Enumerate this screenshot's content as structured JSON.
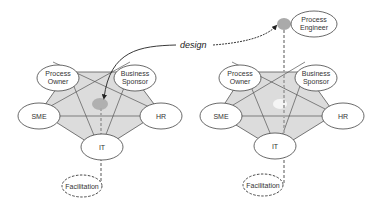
{
  "diagram": {
    "annotation": "design",
    "left": {
      "nodes": {
        "process_owner": [
          "Process",
          "Owner"
        ],
        "business_sponsor": [
          "Business",
          "Sponsor"
        ],
        "sme": "SME",
        "hr": "HR",
        "it": "IT",
        "facilitation": "Facilitation"
      }
    },
    "right": {
      "nodes": {
        "process_engineer": [
          "Process",
          "Engineer"
        ],
        "process_owner": [
          "Process",
          "Owner"
        ],
        "business_sponsor": [
          "Business",
          "Sponsor"
        ],
        "sme": "SME",
        "hr": "HR",
        "it": "IT",
        "facilitation": "Facilitation"
      }
    },
    "colors": {
      "pentagon_fill": "#dcdcdc",
      "line": "#555555",
      "core_blob": "#b0b0b0",
      "dashed_link": "#aaaaaa"
    }
  }
}
